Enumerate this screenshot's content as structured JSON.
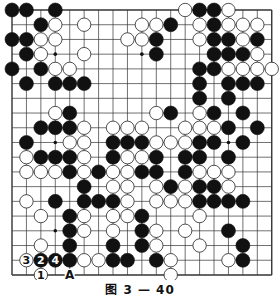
{
  "diagram": {
    "type": "go-board",
    "size": 19,
    "caption": "图 3 — 40",
    "colors": {
      "background": "#ffffff",
      "line": "#333333",
      "black": "#111111",
      "white": "#ffffff"
    },
    "hoshi": [
      [
        3,
        3
      ],
      [
        3,
        9
      ],
      [
        3,
        15
      ],
      [
        9,
        3
      ],
      [
        9,
        9
      ],
      [
        9,
        15
      ],
      [
        15,
        3
      ],
      [
        15,
        9
      ],
      [
        15,
        15
      ]
    ],
    "stones": {
      "black": [
        [
          0,
          0
        ],
        [
          0,
          1
        ],
        [
          0,
          3
        ],
        [
          0,
          13
        ],
        [
          0,
          14
        ],
        [
          1,
          2
        ],
        [
          1,
          11
        ],
        [
          1,
          14
        ],
        [
          2,
          0
        ],
        [
          2,
          1
        ],
        [
          2,
          10
        ],
        [
          2,
          14
        ],
        [
          2,
          15
        ],
        [
          2,
          17
        ],
        [
          3,
          1
        ],
        [
          3,
          10
        ],
        [
          3,
          14
        ],
        [
          3,
          15
        ],
        [
          3,
          16
        ],
        [
          4,
          0
        ],
        [
          4,
          2
        ],
        [
          4,
          13
        ],
        [
          4,
          14
        ],
        [
          5,
          1
        ],
        [
          5,
          3
        ],
        [
          5,
          4
        ],
        [
          5,
          5
        ],
        [
          5,
          13
        ],
        [
          5,
          15
        ],
        [
          5,
          16
        ],
        [
          5,
          17
        ],
        [
          6,
          13
        ],
        [
          6,
          15
        ],
        [
          7,
          4
        ],
        [
          7,
          11
        ],
        [
          7,
          14
        ],
        [
          7,
          16
        ],
        [
          8,
          2
        ],
        [
          8,
          3
        ],
        [
          8,
          4
        ],
        [
          8,
          15
        ],
        [
          8,
          17
        ],
        [
          9,
          1
        ],
        [
          9,
          7
        ],
        [
          9,
          8
        ],
        [
          9,
          9
        ],
        [
          9,
          13
        ],
        [
          9,
          14
        ],
        [
          9,
          16
        ],
        [
          10,
          2
        ],
        [
          10,
          3
        ],
        [
          10,
          4
        ],
        [
          10,
          7
        ],
        [
          10,
          10
        ],
        [
          10,
          12
        ],
        [
          10,
          13
        ],
        [
          10,
          15
        ],
        [
          11,
          4
        ],
        [
          11,
          6
        ],
        [
          11,
          9
        ],
        [
          11,
          10
        ],
        [
          11,
          12
        ],
        [
          12,
          5
        ],
        [
          12,
          11
        ],
        [
          12,
          13
        ],
        [
          12,
          14
        ],
        [
          13,
          3
        ],
        [
          13,
          5
        ],
        [
          13,
          6
        ],
        [
          13,
          7
        ],
        [
          13,
          13
        ],
        [
          13,
          14
        ],
        [
          13,
          15
        ],
        [
          13,
          16
        ],
        [
          14,
          4
        ],
        [
          14,
          9
        ],
        [
          15,
          4
        ],
        [
          15,
          9
        ],
        [
          15,
          15
        ],
        [
          16,
          4
        ],
        [
          16,
          7
        ],
        [
          16,
          9
        ],
        [
          16,
          16
        ],
        [
          17,
          4
        ],
        [
          17,
          7
        ],
        [
          17,
          8
        ],
        [
          17,
          10
        ],
        [
          17,
          16
        ]
      ],
      "white": [
        [
          0,
          12
        ],
        [
          0,
          15
        ],
        [
          1,
          3
        ],
        [
          1,
          5
        ],
        [
          1,
          9
        ],
        [
          1,
          10
        ],
        [
          1,
          13
        ],
        [
          1,
          15
        ],
        [
          1,
          16
        ],
        [
          1,
          17
        ],
        [
          2,
          2
        ],
        [
          2,
          3
        ],
        [
          2,
          8
        ],
        [
          2,
          9
        ],
        [
          2,
          13
        ],
        [
          2,
          16
        ],
        [
          3,
          2
        ],
        [
          3,
          5
        ],
        [
          3,
          17
        ],
        [
          4,
          3
        ],
        [
          4,
          4
        ],
        [
          4,
          15
        ],
        [
          4,
          16
        ],
        [
          4,
          17
        ],
        [
          4,
          18
        ],
        [
          7,
          3
        ],
        [
          7,
          10
        ],
        [
          7,
          13
        ],
        [
          8,
          5
        ],
        [
          8,
          7
        ],
        [
          8,
          8
        ],
        [
          8,
          9
        ],
        [
          8,
          12
        ],
        [
          8,
          13
        ],
        [
          8,
          14
        ],
        [
          9,
          4
        ],
        [
          9,
          5
        ],
        [
          9,
          10
        ],
        [
          9,
          11
        ],
        [
          9,
          12
        ],
        [
          10,
          1
        ],
        [
          10,
          5
        ],
        [
          10,
          8
        ],
        [
          10,
          9
        ],
        [
          11,
          1
        ],
        [
          11,
          2
        ],
        [
          11,
          3
        ],
        [
          11,
          5
        ],
        [
          11,
          7
        ],
        [
          11,
          8
        ],
        [
          11,
          13
        ],
        [
          11,
          14
        ],
        [
          11,
          15
        ],
        [
          12,
          7
        ],
        [
          12,
          8
        ],
        [
          12,
          10
        ],
        [
          12,
          12
        ],
        [
          12,
          15
        ],
        [
          13,
          1
        ],
        [
          13,
          8
        ],
        [
          13,
          10
        ],
        [
          13,
          11
        ],
        [
          13,
          12
        ],
        [
          14,
          2
        ],
        [
          14,
          5
        ],
        [
          14,
          7
        ],
        [
          14,
          8
        ],
        [
          14,
          13
        ],
        [
          15,
          5
        ],
        [
          15,
          7
        ],
        [
          15,
          10
        ],
        [
          15,
          12
        ],
        [
          16,
          2
        ],
        [
          16,
          10
        ],
        [
          16,
          13
        ],
        [
          17,
          5
        ],
        [
          17,
          6
        ],
        [
          17,
          11
        ],
        [
          17,
          15
        ],
        [
          18,
          11
        ]
      ]
    },
    "numbered_stones": [
      {
        "row": 18,
        "col": 2,
        "color": "white",
        "label": "1"
      },
      {
        "row": 17,
        "col": 2,
        "color": "black",
        "label": "2"
      },
      {
        "row": 17,
        "col": 1,
        "color": "white",
        "label": "3"
      },
      {
        "row": 17,
        "col": 3,
        "color": "black",
        "label": "4"
      }
    ],
    "markers": [
      {
        "row": 18,
        "col": 4,
        "label": "A"
      }
    ]
  }
}
